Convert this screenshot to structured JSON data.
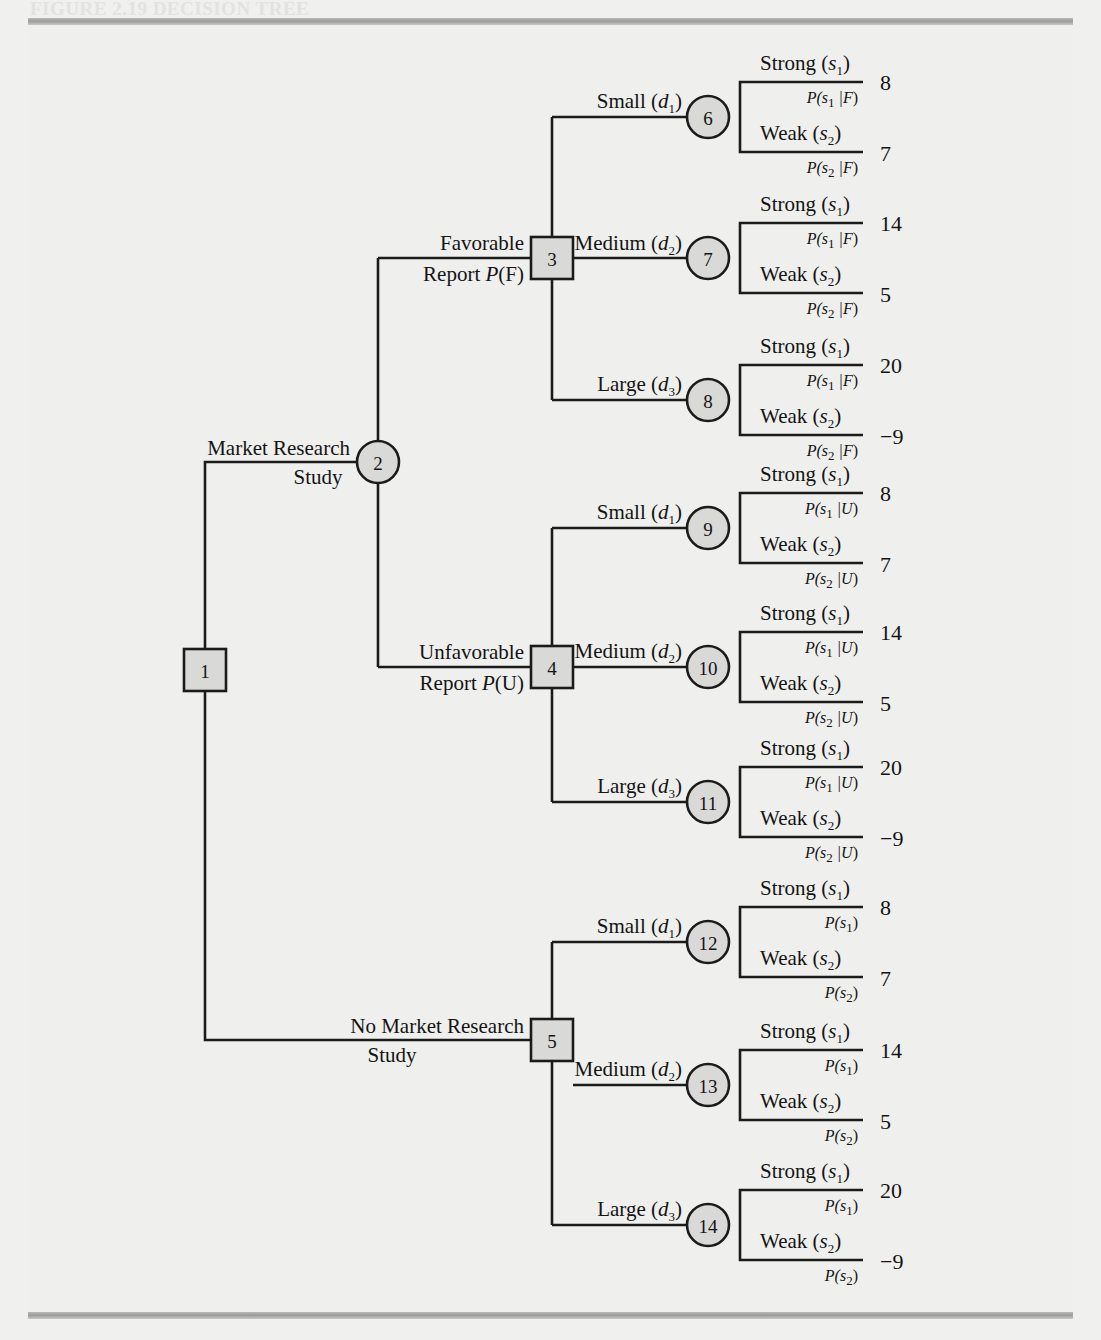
{
  "figure": {
    "title": "FIGURE 2.19   DECISION TREE",
    "rule_color": "#9b9b99",
    "node_fill": "#d9d9d7",
    "line_color": "#1b1b1b"
  },
  "tree": {
    "root": {
      "id": "1",
      "type": "decision"
    },
    "branches": {
      "market_research": {
        "line1": "Market Research",
        "line2": "Study"
      },
      "no_market_research": {
        "line1": "No Market Research",
        "line2": "Study"
      },
      "favorable": {
        "line1": "Favorable",
        "line2_pre": "Report ",
        "line2_p": "P",
        "line2_arg": "(F)"
      },
      "unfavorable": {
        "line1": "Unfavorable",
        "line2_pre": "Report ",
        "line2_p": "P",
        "line2_arg": "(U)"
      }
    },
    "decisions": [
      {
        "label": "Small",
        "var": "d",
        "sub": "1"
      },
      {
        "label": "Medium",
        "var": "d",
        "sub": "2"
      },
      {
        "label": "Large",
        "var": "d",
        "sub": "3"
      }
    ],
    "states": [
      {
        "label": "Strong",
        "var": "s",
        "sub": "1"
      },
      {
        "label": "Weak",
        "var": "s",
        "sub": "2"
      }
    ],
    "nodes": [
      {
        "id": "1",
        "type": "decision"
      },
      {
        "id": "2",
        "type": "chance"
      },
      {
        "id": "3",
        "type": "decision"
      },
      {
        "id": "4",
        "type": "decision"
      },
      {
        "id": "5",
        "type": "decision"
      },
      {
        "id": "6",
        "type": "chance"
      },
      {
        "id": "7",
        "type": "chance"
      },
      {
        "id": "8",
        "type": "chance"
      },
      {
        "id": "9",
        "type": "chance"
      },
      {
        "id": "10",
        "type": "chance"
      },
      {
        "id": "11",
        "type": "chance"
      },
      {
        "id": "12",
        "type": "chance"
      },
      {
        "id": "13",
        "type": "chance"
      },
      {
        "id": "14",
        "type": "chance"
      }
    ],
    "groups": [
      {
        "group": "favorable",
        "condition": "F",
        "chance_nodes": [
          "6",
          "7",
          "8"
        ],
        "payoffs": [
          [
            8,
            7
          ],
          [
            14,
            5
          ],
          [
            20,
            -9
          ]
        ],
        "probability_labels": [
          [
            "P(s1 | F)",
            "P(s2 | F)"
          ],
          [
            "P(s1 | F)",
            "P(s2 | F)"
          ],
          [
            "P(s1 | F)",
            "P(s2 | F)"
          ]
        ]
      },
      {
        "group": "unfavorable",
        "condition": "U",
        "chance_nodes": [
          "9",
          "10",
          "11"
        ],
        "payoffs": [
          [
            8,
            7
          ],
          [
            14,
            5
          ],
          [
            20,
            -9
          ]
        ],
        "probability_labels": [
          [
            "P(s1 | U)",
            "P(s2 | U)"
          ],
          [
            "P(s1 | U)",
            "P(s2 | U)"
          ],
          [
            "P(s1 | U)",
            "P(s2 | U)"
          ]
        ]
      },
      {
        "group": "no_research",
        "condition": "",
        "chance_nodes": [
          "12",
          "13",
          "14"
        ],
        "payoffs": [
          [
            8,
            7
          ],
          [
            14,
            5
          ],
          [
            20,
            -9
          ]
        ],
        "probability_labels": [
          [
            "P(s1)",
            "P(s2)"
          ],
          [
            "P(s1)",
            "P(s2)"
          ],
          [
            "P(s1)",
            "P(s2)"
          ]
        ]
      }
    ],
    "payoff_values": {
      "small_strong": "8",
      "small_weak": "7",
      "medium_strong": "14",
      "medium_weak": "5",
      "large_strong": "20",
      "large_weak": "−9"
    }
  }
}
